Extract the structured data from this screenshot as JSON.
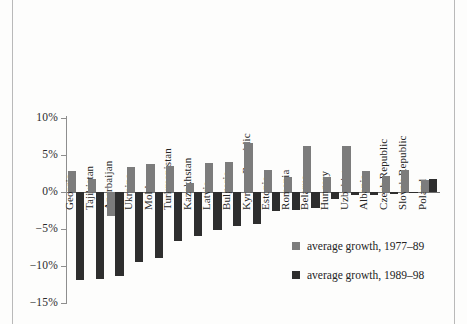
{
  "chart_data": {
    "type": "bar",
    "title": "",
    "subtitle": "",
    "xlabel": "",
    "ylabel": "",
    "ylim": [
      -15,
      10
    ],
    "ytick_labels": [
      "10%",
      "5%",
      "0%",
      "−5%",
      "−10%",
      "−15%"
    ],
    "ytick_values": [
      10,
      5,
      0,
      -5,
      -10,
      -15
    ],
    "grid": false,
    "legend_position": "inside-bottom-right",
    "categories": [
      "Georgia",
      "Tajikistan",
      "Azerbaijan",
      "Ukraine",
      "Moldova",
      "Turkmenistan",
      "Kazakhstan",
      "Latvia",
      "Bulgaria",
      "Kyrgyz Republic",
      "Estonia",
      "Romania",
      "Belarus",
      "Hungary",
      "Uzbekistan",
      "Albania",
      "Czech Republic",
      "Slovak Republic",
      "Poland"
    ],
    "series": [
      {
        "name": "average growth, 1977–89",
        "color": "#7c7c7c",
        "values": [
          2.8,
          1.8,
          -3.2,
          3.4,
          3.8,
          3.5,
          1.2,
          3.9,
          4.0,
          6.6,
          3.0,
          2.0,
          6.2,
          2.0,
          6.2,
          2.8,
          2.2,
          3.0,
          1.6
        ]
      },
      {
        "name": "average growth, 1989–98",
        "color": "#2e2e2e",
        "values": [
          -11.9,
          -11.7,
          -11.3,
          -9.4,
          -8.9,
          -6.6,
          -5.9,
          -5.1,
          -4.6,
          -4.3,
          -2.5,
          -2.4,
          -2.1,
          -0.9,
          -0.4,
          -0.4,
          -0.3,
          -0.1,
          1.8
        ]
      }
    ]
  },
  "legend": {
    "items": [
      {
        "label": "average growth, 1977–89",
        "swatch": "light"
      },
      {
        "label": "average growth, 1989–98",
        "swatch": "dark"
      }
    ]
  }
}
